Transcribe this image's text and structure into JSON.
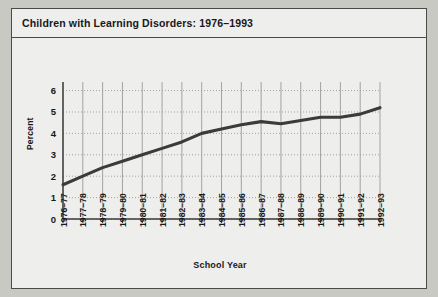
{
  "chart_data": {
    "type": "line",
    "title": "Children with Learning Disorders: 1976–1993",
    "xlabel": "School Year",
    "ylabel": "Percent",
    "categories": [
      "1976–77",
      "1977–78",
      "1978–79",
      "1979–80",
      "1980–81",
      "1981–82",
      "1982–83",
      "1983–84",
      "1984–85",
      "1985–86",
      "1986–87",
      "1987–88",
      "1988–89",
      "1989–90",
      "1990–91",
      "1991–92",
      "1992–93"
    ],
    "values": [
      1.6,
      2.0,
      2.4,
      2.7,
      3.0,
      3.3,
      3.6,
      4.0,
      4.2,
      4.4,
      4.55,
      4.45,
      4.6,
      4.75,
      4.75,
      4.9,
      5.2
    ],
    "yticks": [
      0,
      1,
      2,
      3,
      4,
      5,
      6
    ],
    "ylim": [
      0,
      6.4
    ],
    "grid": "both",
    "legend": "none",
    "series_color": "#3b3b3d",
    "grid_color": "#9a9a98",
    "axis_color": "#3a3a38",
    "plot_background": "#eeeeec"
  }
}
